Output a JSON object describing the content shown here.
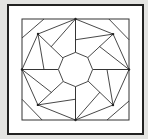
{
  "figure": {
    "colors": {
      "background": "#e4e4e2",
      "panel": "#ffffff",
      "frame": "#222222",
      "line": "#333333"
    },
    "outer_frame": {
      "x": 8,
      "y": 5,
      "w": 135,
      "h": 129
    },
    "inner_square": {
      "x": 22,
      "y": 19,
      "w": 107,
      "h": 101
    },
    "octagon_radius": 0.32,
    "quadrant_segments": [
      [
        [
          -0.589,
          -1
        ],
        [
          -1,
          -0.624
        ]
      ],
      [
        [
          -0.701,
          -0.703
        ],
        [
          -1,
          0
        ]
      ],
      [
        [
          -0.701,
          -0.703
        ],
        [
          -0.589,
          0
        ]
      ],
      [
        [
          -0.701,
          -0.703
        ],
        [
          0,
          -1
        ]
      ],
      [
        [
          -0.701,
          -0.703
        ],
        [
          -0.234,
          -0.228
        ]
      ],
      [
        [
          -0.458,
          -0.446
        ],
        [
          0,
          -1
        ]
      ],
      [
        [
          -1,
          0
        ],
        [
          -0.32,
          0
        ]
      ]
    ],
    "vertex_dots": [
      [
        -0.701,
        -0.703
      ],
      [
        0,
        -1
      ]
    ]
  }
}
